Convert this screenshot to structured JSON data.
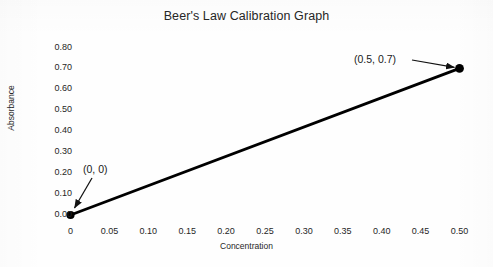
{
  "chart_data": {
    "type": "line",
    "title": "Beer's Law Calibration Graph",
    "xlabel": "Concentration",
    "ylabel": "Absorbance",
    "xlim": [
      0,
      0.5
    ],
    "ylim": [
      0,
      0.8
    ],
    "grid": false,
    "legend": "none",
    "line_color": "#000000",
    "marker_color": "#000000",
    "x": [
      0,
      0.5
    ],
    "y": [
      0,
      0.7
    ],
    "series": [
      {
        "name": "Calibration line",
        "points": [
          {
            "x": 0,
            "y": 0
          },
          {
            "x": 0.5,
            "y": 0.7
          }
        ]
      }
    ],
    "xticks": [
      "0",
      "0.05",
      "0.10",
      "0.15",
      "0.20",
      "0.25",
      "0.30",
      "0.35",
      "0.40",
      "0.45",
      "0.50"
    ],
    "xtick_values": [
      0,
      0.05,
      0.1,
      0.15,
      0.2,
      0.25,
      0.3,
      0.35,
      0.4,
      0.45,
      0.5
    ],
    "yticks": [
      "0.00",
      "0.10",
      "0.20",
      "0.30",
      "0.40",
      "0.50",
      "0.60",
      "0.70",
      "0.80"
    ],
    "ytick_values": [
      0,
      0.1,
      0.2,
      0.3,
      0.4,
      0.5,
      0.6,
      0.7,
      0.8
    ],
    "annotations": [
      {
        "label": "(0, 0)",
        "target_x": 0,
        "target_y": 0
      },
      {
        "label": "(0.5, 0.7)",
        "target_x": 0.5,
        "target_y": 0.7
      }
    ]
  },
  "figure": {
    "background_color": "#fefefe"
  }
}
